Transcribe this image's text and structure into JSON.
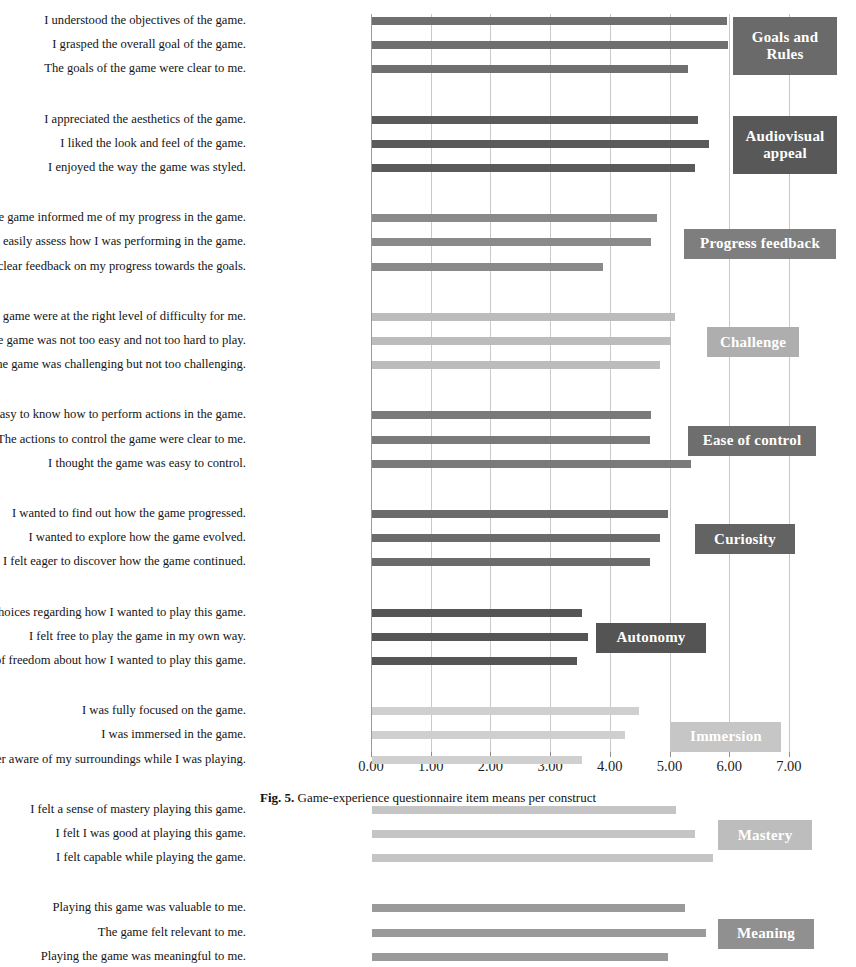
{
  "figure": {
    "caption_label": "Fig. 5.",
    "caption_text": "Game-experience questionnaire item means per construct"
  },
  "chart_data": {
    "type": "bar",
    "orientation": "horizontal",
    "title": "",
    "xlabel": "",
    "ylabel": "",
    "xlim": [
      0,
      7
    ],
    "xticks": [
      "0.00",
      "1.00",
      "2.00",
      "3.00",
      "4.00",
      "5.00",
      "6.00",
      "7.00"
    ],
    "grid": true,
    "legend": "right-side group boxes",
    "groups": [
      {
        "name": "Goals and Rules",
        "color": "#6f6f6f",
        "box_color": "#6a6a6a",
        "items": [
          {
            "label": "I understood the objectives of the game.",
            "value": 5.94
          },
          {
            "label": "I grasped the overall goal of the game.",
            "value": 5.97
          },
          {
            "label": "The goals of the game were clear to me.",
            "value": 5.3
          }
        ]
      },
      {
        "name": "Audiovisual appeal",
        "color": "#5a5a5a",
        "box_color": "#585858",
        "items": [
          {
            "label": "I appreciated the aesthetics of the game.",
            "value": 5.46
          },
          {
            "label": "I liked the look and feel of the game.",
            "value": 5.65
          },
          {
            "label": "I enjoyed the way the game was styled.",
            "value": 5.41
          }
        ]
      },
      {
        "name": "Progress feedback",
        "color": "#8a8a8a",
        "box_color": "#7e7e7e",
        "items": [
          {
            "label": "The game informed me of my progress in the game.",
            "value": 4.78
          },
          {
            "label": "I could easily assess how I was performing in the game.",
            "value": 4.68
          },
          {
            "label": "The game gave clear feedback on my progress towards the goals.",
            "value": 3.87
          }
        ]
      },
      {
        "name": "Challenge",
        "color": "#bcbcbc",
        "box_color": "#aeaeae",
        "items": [
          {
            "label": "The challenges in the game were at the right level of difficulty for me.",
            "value": 5.07
          },
          {
            "label": "The game was not too easy and not too hard to play.",
            "value": 5.01
          },
          {
            "label": "The game was challenging but not too challenging.",
            "value": 4.82
          }
        ]
      },
      {
        "name": "Ease of control",
        "color": "#7a7a7a",
        "box_color": "#6e6e6e",
        "items": [
          {
            "label": "It was easy to know how to perform actions in the game.",
            "value": 4.68
          },
          {
            "label": "The actions to control the game were clear to me.",
            "value": 4.65
          },
          {
            "label": "I thought the game was easy to control.",
            "value": 5.35
          }
        ]
      },
      {
        "name": "Curiosity",
        "color": "#6b6b6b",
        "box_color": "#636363",
        "items": [
          {
            "label": "I wanted to find out how the game progressed.",
            "value": 4.96
          },
          {
            "label": "I wanted to explore how the game evolved.",
            "value": 4.82
          },
          {
            "label": "I felt eager to discover how the game continued.",
            "value": 4.65
          }
        ]
      },
      {
        "name": "Autonomy",
        "color": "#555555",
        "box_color": "#545454",
        "items": [
          {
            "label": "I felt like I had choices regarding how I wanted to play this game.",
            "value": 3.51
          },
          {
            "label": "I felt free to play the game in my own way.",
            "value": 3.62
          },
          {
            "label": "I felt a sense of freedom about how I wanted to play this game.",
            "value": 3.44
          }
        ]
      },
      {
        "name": "Immersion",
        "color": "#cfcfcf",
        "box_color": "#c6c6c6",
        "items": [
          {
            "label": "I was fully focused on the game.",
            "value": 4.47
          },
          {
            "label": "I was immersed in the game.",
            "value": 4.23
          },
          {
            "label": "I was no longer aware of my surroundings while I was playing.",
            "value": 3.51
          }
        ]
      },
      {
        "name": "Mastery",
        "color": "#c5c5c5",
        "box_color": "#bdbdbd",
        "items": [
          {
            "label": "I felt a sense of mastery playing this game.",
            "value": 5.1
          },
          {
            "label": "I felt I was good at playing this game.",
            "value": 5.41
          },
          {
            "label": "I felt capable while playing the game.",
            "value": 5.72
          }
        ]
      },
      {
        "name": "Meaning",
        "color": "#9a9a9a",
        "box_color": "#909090",
        "items": [
          {
            "label": "Playing this game was valuable to me.",
            "value": 5.24
          },
          {
            "label": "The game felt relevant to me.",
            "value": 5.6
          },
          {
            "label": "Playing the game was meaningful to me.",
            "value": 4.96
          }
        ]
      }
    ]
  }
}
